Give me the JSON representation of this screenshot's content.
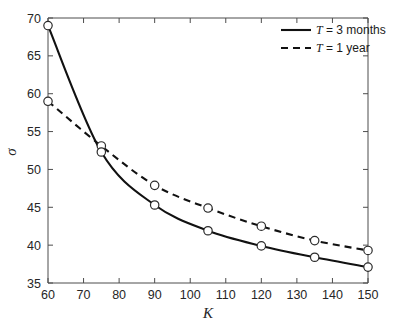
{
  "chart_data": {
    "type": "line",
    "title": "",
    "subtitle": "",
    "xlabel": "K",
    "ylabel": "σ",
    "xlim": [
      60,
      150
    ],
    "ylim": [
      35,
      70
    ],
    "xticks": [
      60,
      70,
      80,
      90,
      100,
      110,
      120,
      130,
      140,
      150
    ],
    "yticks": [
      35,
      40,
      45,
      50,
      55,
      60,
      65,
      70
    ],
    "xtick_labels": [
      "60",
      "70",
      "80",
      "90",
      "100",
      "110",
      "120",
      "130",
      "140",
      "150"
    ],
    "ytick_labels": [
      "35",
      "40",
      "45",
      "50",
      "55",
      "60",
      "65",
      "70"
    ],
    "grid": false,
    "legend_position": "top-right",
    "x": [
      60,
      75,
      90,
      105,
      120,
      135,
      150
    ],
    "series": [
      {
        "name": "T = 3 months",
        "style": "solid",
        "marker": "circle-open",
        "values": [
          69.0,
          52.3,
          45.3,
          41.9,
          39.9,
          38.4,
          37.1
        ]
      },
      {
        "name": "T = 1 year",
        "style": "dashed",
        "marker": "circle-open",
        "values": [
          59.0,
          53.1,
          47.9,
          44.9,
          42.5,
          40.6,
          39.3
        ]
      }
    ],
    "colors": {
      "series_line": "#111111",
      "axis": "#4d4d4d",
      "text": "#262626",
      "marker_fill": "#ffffff",
      "background": "#ffffff"
    }
  },
  "legend": {
    "entries": [
      {
        "prefix": "T",
        "body": " = 3 months",
        "style": "solid"
      },
      {
        "prefix": "T",
        "body": " = 1 year",
        "style": "dashed"
      }
    ]
  },
  "axes": {
    "x_title": "K",
    "y_title": "σ"
  }
}
